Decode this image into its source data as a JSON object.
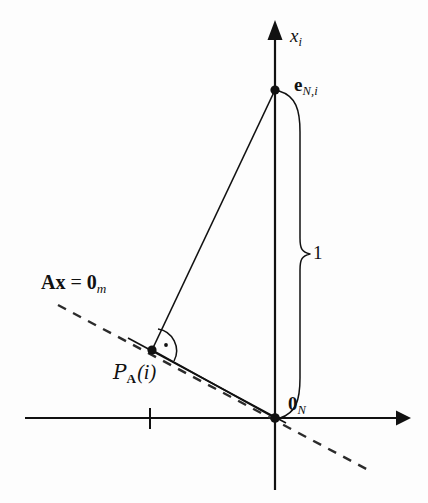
{
  "figure": {
    "kind": "geometric-projection-diagram",
    "background_color": "#fdfdfd",
    "ink_color": "#111111",
    "width": 428,
    "height": 503
  },
  "axes": {
    "vertical": {
      "label_plain": "xi",
      "label_base": "x",
      "label_sub": "i",
      "x": 275,
      "y_top": 22,
      "y_bottom": 490,
      "arrow": "up"
    },
    "horizontal": {
      "label_plain": "",
      "y": 418,
      "x_left": 25,
      "x_right": 405,
      "arrow": "right",
      "tick_x": 150
    }
  },
  "points": [
    {
      "id": "e-vector",
      "label_plain": "eN,i",
      "label_base": "e",
      "label_sub": "N,i",
      "x": 275,
      "y": 90,
      "marker": "filled-dot"
    },
    {
      "id": "projection",
      "label_plain": "PA(i)",
      "label_script": "P",
      "label_sub": "A",
      "label_arg": "(i)",
      "x": 152,
      "y": 350,
      "marker": "filled-dot"
    },
    {
      "id": "origin",
      "label_plain": "0N",
      "label_base": "0",
      "label_sub": "N",
      "x": 275,
      "y": 418,
      "marker": "filled-dot"
    }
  ],
  "nullspace_line": {
    "label_plain": "Ax = 0m",
    "label_A": "A",
    "label_x": "x",
    "label_eq": "=",
    "label_zero": "0",
    "label_sub": "m",
    "style": "dashed",
    "x1": 58,
    "y1": 305,
    "x2": 372,
    "y2": 472
  },
  "brace": {
    "label": "1",
    "spans_from": "e-vector",
    "spans_to": "origin",
    "side": "right"
  },
  "segments": [
    {
      "id": "e-to-projection",
      "from": "e-vector",
      "to": "projection",
      "style": "solid"
    },
    {
      "id": "projection-to-origin",
      "from": "projection",
      "to": "origin",
      "style": "solid"
    },
    {
      "id": "subspace-ray",
      "from": "projection-extended-left",
      "to": "origin",
      "style": "solid"
    }
  ],
  "right_angle_marker": {
    "at": "projection",
    "style": "arc-with-dot"
  }
}
